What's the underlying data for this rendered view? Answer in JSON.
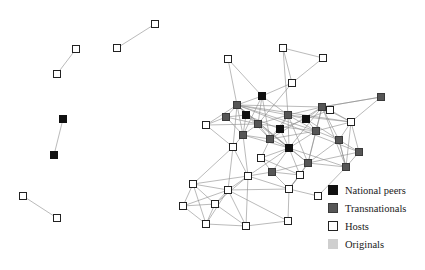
{
  "figure": {
    "width": 425,
    "height": 270,
    "background": "#ffffff"
  },
  "legend": {
    "name": "node-type-legend",
    "items": [
      {
        "label": "National peers",
        "swatch": "national-peers-swatch",
        "color": "#111111",
        "border": "#111111"
      },
      {
        "label": "Transnationals",
        "swatch": "transnationals-swatch",
        "color": "#565656",
        "border": "#3a3a3a"
      },
      {
        "label": "Hosts",
        "swatch": "hosts-swatch",
        "color": "#ffffff",
        "border": "#222222"
      },
      {
        "label": "Originals",
        "swatch": "originals-swatch",
        "color": "#cfcfcf",
        "border": "#cfcfcf"
      }
    ]
  },
  "chart_data": {
    "type": "scatter",
    "title": "",
    "xlabel": "",
    "ylabel": "",
    "subtype": "node-link-network-graph",
    "node_types": {
      "national": {
        "legend": "National peers",
        "fill": "#111111",
        "stroke": "#111111"
      },
      "transnational": {
        "legend": "Transnationals",
        "fill": "#565656",
        "stroke": "#3a3a3a"
      },
      "host": {
        "legend": "Hosts",
        "fill": "#ffffff",
        "stroke": "#222222"
      },
      "original": {
        "legend": "Originals",
        "fill": "#cfcfcf",
        "stroke": "#cfcfcf"
      }
    },
    "node_size": 7,
    "edge_color": "#8c8c8c",
    "edge_width": 0.6,
    "counts": {
      "national": 7,
      "transnational": 14,
      "host": 26,
      "original": 0,
      "total_nodes": 47,
      "total_edges": 116
    },
    "nodes": [
      {
        "id": "h1",
        "type": "host",
        "x": 76,
        "y": 49
      },
      {
        "id": "h2",
        "type": "host",
        "x": 57,
        "y": 74
      },
      {
        "id": "h3",
        "type": "host",
        "x": 155,
        "y": 24
      },
      {
        "id": "h4",
        "type": "host",
        "x": 117,
        "y": 48
      },
      {
        "id": "n1",
        "type": "national",
        "x": 63,
        "y": 119
      },
      {
        "id": "n2",
        "type": "national",
        "x": 54,
        "y": 155
      },
      {
        "id": "h5",
        "type": "host",
        "x": 23,
        "y": 196
      },
      {
        "id": "h6",
        "type": "host",
        "x": 57,
        "y": 218
      },
      {
        "id": "h7",
        "type": "host",
        "x": 283,
        "y": 48
      },
      {
        "id": "h8",
        "type": "host",
        "x": 323,
        "y": 58
      },
      {
        "id": "h9",
        "type": "host",
        "x": 292,
        "y": 83
      },
      {
        "id": "h10",
        "type": "host",
        "x": 228,
        "y": 59
      },
      {
        "id": "n3",
        "type": "national",
        "x": 262,
        "y": 96
      },
      {
        "id": "t1",
        "type": "transnational",
        "x": 237,
        "y": 105
      },
      {
        "id": "t2",
        "type": "transnational",
        "x": 322,
        "y": 107
      },
      {
        "id": "t3",
        "type": "transnational",
        "x": 381,
        "y": 97
      },
      {
        "id": "t4",
        "type": "transnational",
        "x": 288,
        "y": 115
      },
      {
        "id": "t5",
        "type": "transnational",
        "x": 258,
        "y": 124
      },
      {
        "id": "h11",
        "type": "host",
        "x": 351,
        "y": 122
      },
      {
        "id": "t6",
        "type": "transnational",
        "x": 316,
        "y": 131
      },
      {
        "id": "n4",
        "type": "national",
        "x": 289,
        "y": 148
      },
      {
        "id": "t7",
        "type": "transnational",
        "x": 359,
        "y": 152
      },
      {
        "id": "t8",
        "type": "transnational",
        "x": 243,
        "y": 135
      },
      {
        "id": "h12",
        "type": "host",
        "x": 233,
        "y": 147
      },
      {
        "id": "t9",
        "type": "transnational",
        "x": 308,
        "y": 163
      },
      {
        "id": "t10",
        "type": "transnational",
        "x": 346,
        "y": 167
      },
      {
        "id": "t11",
        "type": "transnational",
        "x": 272,
        "y": 172
      },
      {
        "id": "h13",
        "type": "host",
        "x": 248,
        "y": 176
      },
      {
        "id": "h14",
        "type": "host",
        "x": 228,
        "y": 190
      },
      {
        "id": "h15",
        "type": "host",
        "x": 289,
        "y": 189
      },
      {
        "id": "h16",
        "type": "host",
        "x": 318,
        "y": 196
      },
      {
        "id": "h17",
        "type": "host",
        "x": 193,
        "y": 184
      },
      {
        "id": "h18",
        "type": "host",
        "x": 183,
        "y": 206
      },
      {
        "id": "h19",
        "type": "host",
        "x": 215,
        "y": 204
      },
      {
        "id": "h20",
        "type": "host",
        "x": 206,
        "y": 224
      },
      {
        "id": "h21",
        "type": "host",
        "x": 246,
        "y": 226
      },
      {
        "id": "h22",
        "type": "host",
        "x": 288,
        "y": 221
      },
      {
        "id": "h23",
        "type": "host",
        "x": 206,
        "y": 125
      },
      {
        "id": "t12",
        "type": "transnational",
        "x": 226,
        "y": 117
      },
      {
        "id": "t13",
        "type": "transnational",
        "x": 339,
        "y": 140
      },
      {
        "id": "t14",
        "type": "transnational",
        "x": 270,
        "y": 139
      },
      {
        "id": "n5",
        "type": "national",
        "x": 306,
        "y": 119
      },
      {
        "id": "n6",
        "type": "national",
        "x": 246,
        "y": 115
      },
      {
        "id": "n7",
        "type": "national",
        "x": 280,
        "y": 129
      },
      {
        "id": "h24",
        "type": "host",
        "x": 330,
        "y": 110
      },
      {
        "id": "h25",
        "type": "host",
        "x": 261,
        "y": 158
      },
      {
        "id": "h26",
        "type": "host",
        "x": 300,
        "y": 175
      }
    ],
    "edges": [
      [
        "h1",
        "h2"
      ],
      [
        "h3",
        "h4"
      ],
      [
        "n1",
        "n2"
      ],
      [
        "h5",
        "h6"
      ],
      [
        "h7",
        "h8"
      ],
      [
        "h7",
        "h9"
      ],
      [
        "h8",
        "h9"
      ],
      [
        "h9",
        "n3"
      ],
      [
        "h10",
        "t1"
      ],
      [
        "h9",
        "t5"
      ],
      [
        "h7",
        "t4"
      ],
      [
        "n3",
        "t1"
      ],
      [
        "n3",
        "t5"
      ],
      [
        "n3",
        "t8"
      ],
      [
        "n3",
        "t14"
      ],
      [
        "n3",
        "t4"
      ],
      [
        "t1",
        "t5"
      ],
      [
        "t1",
        "t8"
      ],
      [
        "t1",
        "t12"
      ],
      [
        "t1",
        "t2"
      ],
      [
        "t1",
        "t4"
      ],
      [
        "t1",
        "t6"
      ],
      [
        "t1",
        "t9"
      ],
      [
        "t1",
        "n4"
      ],
      [
        "t1",
        "t14"
      ],
      [
        "t1",
        "h12"
      ],
      [
        "t1",
        "h11"
      ],
      [
        "t1",
        "t7"
      ],
      [
        "t1",
        "h23"
      ],
      [
        "t2",
        "t3"
      ],
      [
        "t2",
        "t6"
      ],
      [
        "t2",
        "h11"
      ],
      [
        "t2",
        "t4"
      ],
      [
        "t2",
        "t13"
      ],
      [
        "t2",
        "n4"
      ],
      [
        "t2",
        "t9"
      ],
      [
        "t2",
        "t14"
      ],
      [
        "t2",
        "t10"
      ],
      [
        "t2",
        "n5"
      ],
      [
        "t3",
        "h11"
      ],
      [
        "t3",
        "t2"
      ],
      [
        "t4",
        "t5"
      ],
      [
        "t4",
        "t6"
      ],
      [
        "t4",
        "n4"
      ],
      [
        "t4",
        "t14"
      ],
      [
        "t4",
        "n7"
      ],
      [
        "t4",
        "t9"
      ],
      [
        "t4",
        "h11"
      ],
      [
        "t4",
        "n5"
      ],
      [
        "t5",
        "t8"
      ],
      [
        "t5",
        "n4"
      ],
      [
        "t5",
        "t14"
      ],
      [
        "t5",
        "n6"
      ],
      [
        "t5",
        "t6"
      ],
      [
        "h11",
        "t6"
      ],
      [
        "h11",
        "t13"
      ],
      [
        "h11",
        "t7"
      ],
      [
        "h11",
        "t10"
      ],
      [
        "h11",
        "h24"
      ],
      [
        "t6",
        "n4"
      ],
      [
        "t6",
        "t9"
      ],
      [
        "t6",
        "t13"
      ],
      [
        "t6",
        "n5"
      ],
      [
        "t6",
        "t14"
      ],
      [
        "n4",
        "t9"
      ],
      [
        "n4",
        "t11"
      ],
      [
        "n4",
        "t10"
      ],
      [
        "n4",
        "t14"
      ],
      [
        "n4",
        "h25"
      ],
      [
        "n4",
        "h13"
      ],
      [
        "n4",
        "t8"
      ],
      [
        "n4",
        "h26"
      ],
      [
        "t7",
        "t10"
      ],
      [
        "t7",
        "t13"
      ],
      [
        "t7",
        "t9"
      ],
      [
        "t8",
        "h12"
      ],
      [
        "t8",
        "t14"
      ],
      [
        "t8",
        "h13"
      ],
      [
        "t8",
        "n6"
      ],
      [
        "h12",
        "h13"
      ],
      [
        "h12",
        "h17"
      ],
      [
        "h12",
        "h14"
      ],
      [
        "t9",
        "t10"
      ],
      [
        "t9",
        "t11"
      ],
      [
        "t9",
        "h15"
      ],
      [
        "t9",
        "h26"
      ],
      [
        "t9",
        "t13"
      ],
      [
        "t10",
        "h16"
      ],
      [
        "t10",
        "t13"
      ],
      [
        "t11",
        "h13"
      ],
      [
        "t11",
        "h15"
      ],
      [
        "t11",
        "h25"
      ],
      [
        "t11",
        "h26"
      ],
      [
        "h13",
        "h14"
      ],
      [
        "h13",
        "h19"
      ],
      [
        "h13",
        "h21"
      ],
      [
        "h13",
        "h15"
      ],
      [
        "h13",
        "h17"
      ],
      [
        "h14",
        "h17"
      ],
      [
        "h14",
        "h19"
      ],
      [
        "h14",
        "h20"
      ],
      [
        "h14",
        "h21"
      ],
      [
        "h14",
        "h18"
      ],
      [
        "h14",
        "h22"
      ],
      [
        "h14",
        "h15"
      ],
      [
        "h15",
        "h16"
      ],
      [
        "h15",
        "h22"
      ],
      [
        "h15",
        "h26"
      ],
      [
        "h17",
        "h18"
      ],
      [
        "h17",
        "h19"
      ],
      [
        "h17",
        "h20"
      ],
      [
        "h18",
        "h19"
      ],
      [
        "h18",
        "h20"
      ],
      [
        "h19",
        "h20"
      ],
      [
        "h19",
        "h21"
      ],
      [
        "h20",
        "h21"
      ],
      [
        "h21",
        "h22"
      ],
      [
        "h23",
        "t12"
      ],
      [
        "h23",
        "h12"
      ],
      [
        "h23",
        "t5"
      ],
      [
        "t12",
        "n6"
      ],
      [
        "t12",
        "t5"
      ],
      [
        "t12",
        "t8"
      ],
      [
        "n5",
        "n7"
      ],
      [
        "n5",
        "t13"
      ],
      [
        "n6",
        "n7"
      ],
      [
        "n7",
        "t14"
      ],
      [
        "n7",
        "n4"
      ],
      [
        "t13",
        "t10"
      ],
      [
        "t14",
        "h25"
      ],
      [
        "h24",
        "t2"
      ],
      [
        "h24",
        "n5"
      ],
      [
        "h25",
        "h26"
      ],
      [
        "h26",
        "h15"
      ],
      [
        "h10",
        "n3"
      ]
    ]
  }
}
